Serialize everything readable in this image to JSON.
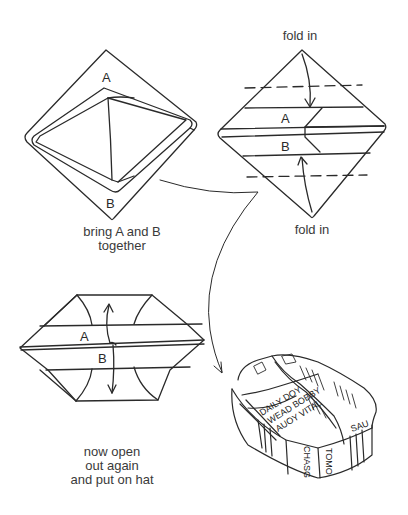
{
  "steps": [
    {
      "id": "step-1",
      "labels": {
        "top": "A",
        "bottom": "B"
      },
      "caption": [
        "bring A and B",
        "together"
      ]
    },
    {
      "id": "step-2",
      "labels": {
        "top": "A",
        "bottom": "B"
      },
      "annotations": {
        "top": "fold in",
        "bottom": "fold in"
      }
    },
    {
      "id": "step-3",
      "labels": {
        "top": "A",
        "bottom": "B"
      },
      "caption": [
        "now open",
        "out again",
        "and put on hat"
      ]
    },
    {
      "id": "step-4",
      "description": "finished newspaper hat",
      "newspaper_text": [
        "DAILY DOY",
        "WEAD BOBBY",
        "AUOY VITAL",
        "TOMO",
        "CHASG",
        "SAU"
      ]
    }
  ],
  "colors": {
    "ink": "#2a2a2a",
    "background": "#ffffff"
  }
}
